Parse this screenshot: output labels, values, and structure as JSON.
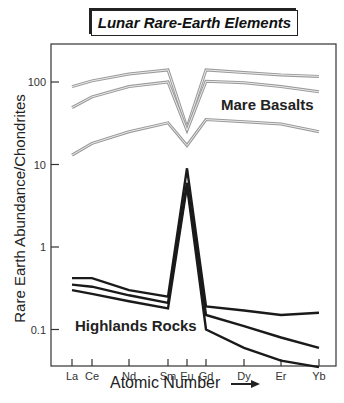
{
  "title": "Lunar Rare-Earth Elements",
  "chart_data": {
    "type": "line",
    "title": "Lunar Rare-Earth Elements",
    "xlabel": "Atomic Number →",
    "ylabel": "Rare Earth Abundance/Chondrites",
    "yscale": "log",
    "ylim": [
      0.03,
      300
    ],
    "yticks": [
      "100",
      "10",
      "1",
      "0.1"
    ],
    "categories": [
      "La",
      "Ce",
      "Nd",
      "Sm",
      "Eu",
      "Gd",
      "Dy",
      "Er",
      "Yb"
    ],
    "annotations": [
      "Mare Basalts",
      "Highlands Rocks"
    ],
    "series": [
      {
        "name": "Mare Basalts 1",
        "group": "Mare Basalts",
        "color": "#9a9a9a",
        "values": [
          88,
          103,
          125,
          140,
          28,
          140,
          130,
          122,
          117
        ]
      },
      {
        "name": "Mare Basalts 2",
        "group": "Mare Basalts",
        "color": "#9a9a9a",
        "values": [
          49,
          66,
          88,
          100,
          26,
          102,
          98,
          88,
          76
        ]
      },
      {
        "name": "Mare Basalts 3",
        "group": "Mare Basalts",
        "color": "#9a9a9a",
        "values": [
          13,
          18,
          25,
          32,
          17,
          35,
          33,
          31,
          25
        ]
      },
      {
        "name": "Highlands Rocks 1",
        "group": "Highlands Rocks",
        "color": "#1a1a1a",
        "values": [
          0.42,
          0.42,
          0.3,
          0.25,
          9,
          0.19,
          0.17,
          0.15,
          0.16
        ]
      },
      {
        "name": "Highlands Rocks 2",
        "group": "Highlands Rocks",
        "color": "#1a1a1a",
        "values": [
          0.35,
          0.33,
          0.26,
          0.21,
          6,
          0.15,
          0.11,
          0.08,
          0.06
        ]
      },
      {
        "name": "Highlands Rocks 3",
        "group": "Highlands Rocks",
        "color": "#1a1a1a",
        "values": [
          0.3,
          0.27,
          0.22,
          0.18,
          5.5,
          0.1,
          0.06,
          0.042,
          0.035
        ]
      }
    ]
  },
  "labels": {
    "mare": "Mare Basalts",
    "highlands": "Highlands Rocks",
    "xlabel": "Atomic Number",
    "ylabel": "Rare Earth Abundance/Chondrites"
  }
}
